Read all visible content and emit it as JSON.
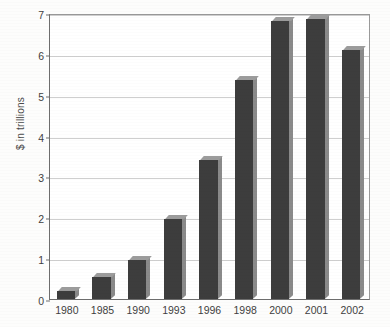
{
  "chart_data": {
    "type": "bar",
    "title": "",
    "subtitle": "",
    "xlabel": "",
    "ylabel": "$ in trillions",
    "categories": [
      "1980",
      "1985",
      "1990",
      "1993",
      "1996",
      "1998",
      "2000",
      "2001",
      "2002"
    ],
    "values": [
      0.2,
      0.55,
      0.95,
      1.95,
      3.4,
      5.35,
      6.8,
      6.85,
      6.1
    ],
    "ylim": [
      0,
      7
    ],
    "ytick_labels": [
      "0",
      "1",
      "2",
      "3",
      "4",
      "5",
      "6",
      "7"
    ],
    "ytick_values": [
      0,
      1,
      2,
      3,
      4,
      5,
      6,
      7
    ],
    "grid": true,
    "grid_axis": "y",
    "legend": false,
    "legend_position": "none",
    "series": [
      {
        "name": "",
        "values": [
          0.2,
          0.55,
          0.95,
          1.95,
          3.4,
          5.35,
          6.8,
          6.85,
          6.1
        ]
      }
    ]
  },
  "colors": {
    "bar_face": "#3d3d3d",
    "bar_top": "#9c9c9c",
    "bar_side": "#8a8a8a",
    "gridline": "#cfcfcf",
    "axis": "#6e6e6e",
    "plot_background": "#ffffff",
    "page_background": "#fdfdfc",
    "text": "#3f3f3f"
  }
}
